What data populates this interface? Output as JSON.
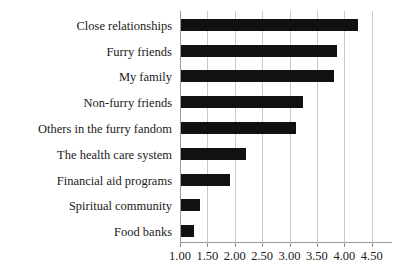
{
  "chart_data": {
    "type": "bar",
    "orientation": "horizontal",
    "title": "",
    "xlabel": "",
    "ylabel": "",
    "categories": [
      "Close relationships",
      "Furry friends",
      "My family",
      "Non-furry friends",
      "Others in the furry fandom",
      "The health care system",
      "Financial aid programs",
      "Spiritual community",
      "Food banks"
    ],
    "values": [
      4.23,
      3.84,
      3.8,
      3.22,
      3.1,
      2.18,
      1.9,
      1.35,
      1.23
    ],
    "xlim": [
      1.0,
      4.5
    ],
    "xticks": [
      1.0,
      1.5,
      2.0,
      2.5,
      3.0,
      3.5,
      4.0,
      4.5
    ],
    "xtick_labels": [
      "1.00",
      "1.50",
      "2.00",
      "2.50",
      "3.00",
      "3.50",
      "4.00",
      "4.50"
    ],
    "grid": "vertical",
    "legend": "none",
    "bar_color": "#111111",
    "gridline_color": "#c9c9c9",
    "axis_color": "#9a9a9a"
  }
}
